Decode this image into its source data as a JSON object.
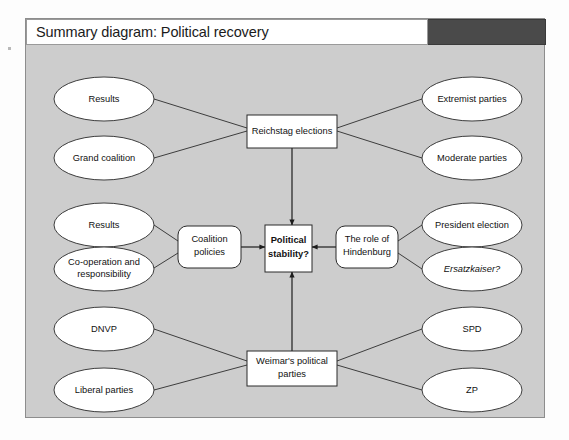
{
  "title": "Summary diagram: Political recovery",
  "diagram": {
    "nodes": {
      "results_top": "Results",
      "grand_coalition": "Grand coalition",
      "reichstag_italic": "Reichstag",
      "reichstag_rest": " elections",
      "extremist_parties": "Extremist parties",
      "moderate_parties": "Moderate parties",
      "results_mid": "Results",
      "cooperation_line1": "Co-operation and",
      "cooperation_line2": "responsibility",
      "coalition_line1": "Coalition",
      "coalition_line2": "policies",
      "stability_line1": "Political",
      "stability_line2": "stability?",
      "hindenburg_line1": "The role of",
      "hindenburg_line2": "Hindenburg",
      "president_election": "President election",
      "ersatzkaiser": "Ersatzkaiser?",
      "dnvp": "DNVP",
      "liberal_parties": "Liberal parties",
      "weimar_line1": "Weimar's political",
      "weimar_line2": "parties",
      "spd": "SPD",
      "zp": "ZP"
    }
  },
  "colors": {
    "panel_background": "#cdcdcd",
    "title_bar_dark": "#4a4a4a",
    "node_fill": "#ffffff",
    "stroke": "#2a2a2a"
  }
}
